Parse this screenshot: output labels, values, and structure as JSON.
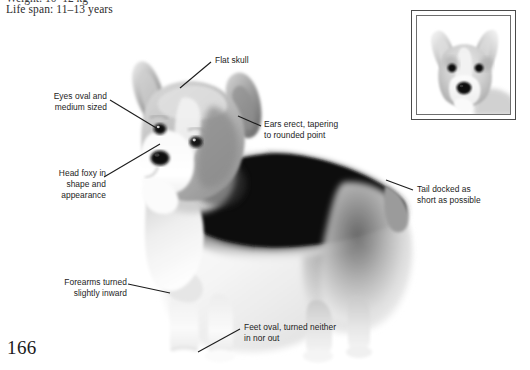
{
  "page": {
    "folio": "166",
    "spec_cut_text": "Weight: 10–12 kg",
    "spec_line": "Life span: 11–13 years"
  },
  "figure": {
    "main_photo_name": "pembroke-welsh-corgi-standing-photo",
    "inset_photo_name": "corgi-head-portrait-photo",
    "ink_color": "#1c1c1c",
    "frame_color": "#4a4a4a"
  },
  "callouts": [
    {
      "id": "flat-skull",
      "text": "Flat skull",
      "align": "left",
      "x": 215,
      "y": 59
    },
    {
      "id": "eyes",
      "text": "Eyes oval and\nmedium sized",
      "align": "right",
      "x": 27,
      "y": 94
    },
    {
      "id": "ears",
      "text": "Ears erect, tapering\nto rounded point",
      "align": "left",
      "x": 264,
      "y": 122
    },
    {
      "id": "head-foxy",
      "text": "Head foxy in\nshape and\nappearance",
      "align": "right",
      "x": 28,
      "y": 170
    },
    {
      "id": "tail",
      "text": "Tail docked as\nshort as possible",
      "align": "left",
      "x": 416,
      "y": 187
    },
    {
      "id": "forearms",
      "text": "Forearms turned\nslightly inward",
      "align": "right",
      "x": 39,
      "y": 280
    },
    {
      "id": "feet",
      "text": "Feet oval, turned neither\nin nor out",
      "align": "left",
      "x": 243,
      "y": 325
    }
  ],
  "leader_lines": [
    {
      "id": "leader-flat-skull",
      "x1": 211,
      "y1": 62,
      "x2": 180,
      "y2": 88
    },
    {
      "id": "leader-eyes",
      "x1": 110,
      "y1": 100,
      "x2": 158,
      "y2": 129
    },
    {
      "id": "leader-ears",
      "x1": 261,
      "y1": 126,
      "x2": 238,
      "y2": 116
    },
    {
      "id": "leader-head-foxy",
      "x1": 104,
      "y1": 177,
      "x2": 160,
      "y2": 144
    },
    {
      "id": "leader-tail",
      "x1": 413,
      "y1": 190,
      "x2": 386,
      "y2": 180
    },
    {
      "id": "leader-forearms",
      "x1": 128,
      "y1": 284,
      "x2": 170,
      "y2": 293
    },
    {
      "id": "leader-feet",
      "x1": 240,
      "y1": 329,
      "x2": 198,
      "y2": 352
    }
  ]
}
